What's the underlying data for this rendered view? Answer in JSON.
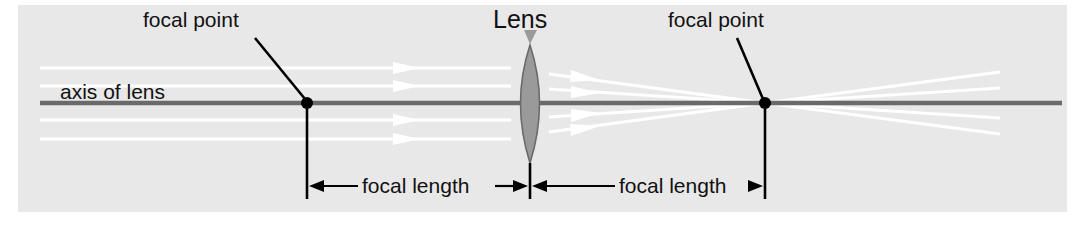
{
  "diagram": {
    "background_color": "#e8e8e8",
    "page_color": "#ffffff",
    "labels": {
      "focal_point_left": "focal point",
      "focal_point_right": "focal point",
      "lens": "Lens",
      "axis_of_lens": "axis of lens",
      "focal_length_left": "focal length",
      "focal_length_right": "focal length"
    },
    "colors": {
      "axis_line": "#6a6a6a",
      "ray_line": "#ffffff",
      "lens_fill": "#9a9a9a",
      "lens_stroke": "#6a6a6a",
      "leader_line": "#000000",
      "dimension_line": "#000000",
      "focal_point_dot": "#000000",
      "text": "#111111"
    },
    "geometry": {
      "axis_y": 103,
      "axis_x_start": 40,
      "axis_x_end": 1062,
      "lens_center_x": 530,
      "lens_half_width": 19,
      "lens_top_y": 45,
      "lens_bottom_y": 163,
      "focal_point_left_x": 307,
      "focal_point_right_x": 765,
      "focal_length_px": 235,
      "ray_count": 4,
      "ray_entry_y": [
        68,
        86,
        120,
        139
      ],
      "dimension_line_y": 186,
      "tick_top_y": 155,
      "tick_bottom_y": 199
    },
    "elements": {
      "axis_name": "optical-axis",
      "lens_name": "biconvex-lens",
      "ray_name": "light-ray",
      "arrowhead_name": "ray-arrowhead",
      "focal_dot_name": "focal-point-dot"
    }
  }
}
